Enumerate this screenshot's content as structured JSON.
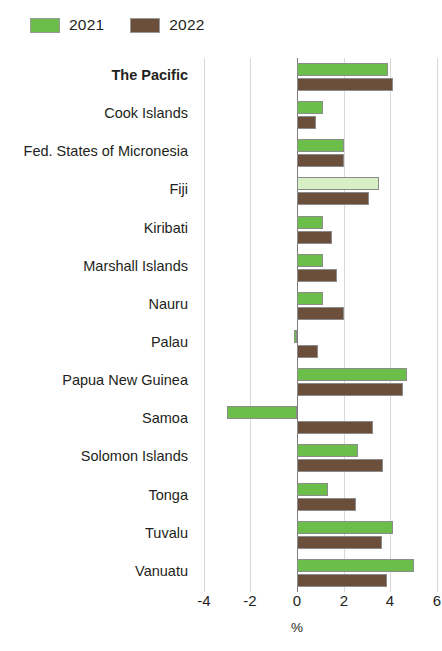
{
  "legend": {
    "entries": [
      {
        "label": "2021",
        "color": "#6CBE4A",
        "icon": "green-swatch-icon"
      },
      {
        "label": "2022",
        "color": "#6B4F3A",
        "icon": "brown-swatch-icon"
      }
    ]
  },
  "axis": {
    "title": "%",
    "ticks": [
      "-4",
      "-2",
      "0",
      "2",
      "4",
      "6"
    ],
    "tick_values": [
      -4,
      -2,
      0,
      2,
      4,
      6
    ]
  },
  "chart_data": {
    "type": "bar",
    "orientation": "horizontal",
    "title": "",
    "xlabel": "%",
    "ylabel": "",
    "xlim": [
      -4,
      6
    ],
    "grid": true,
    "legend_position": "top-left",
    "categories": [
      "The Pacific",
      "Cook Islands",
      "Fed. States of Micronesia",
      "Fiji",
      "Kiribati",
      "Marshall Islands",
      "Nauru",
      "Palau",
      "Papua New Guinea",
      "Samoa",
      "Solomon Islands",
      "Tonga",
      "Tuvalu",
      "Vanuatu"
    ],
    "highlight_category": "The Pacific",
    "series": [
      {
        "name": "2021",
        "color": "#6CBE4A",
        "values": [
          3.9,
          1.1,
          2.0,
          3.5,
          1.1,
          1.1,
          1.1,
          -0.15,
          4.7,
          -3.0,
          2.6,
          1.35,
          4.1,
          5.0
        ]
      },
      {
        "name": "2022",
        "color": "#6B4F3A",
        "values": [
          4.1,
          0.8,
          2.0,
          3.1,
          1.5,
          1.7,
          2.0,
          0.9,
          4.55,
          3.25,
          3.7,
          2.55,
          3.65,
          3.85
        ]
      }
    ]
  }
}
